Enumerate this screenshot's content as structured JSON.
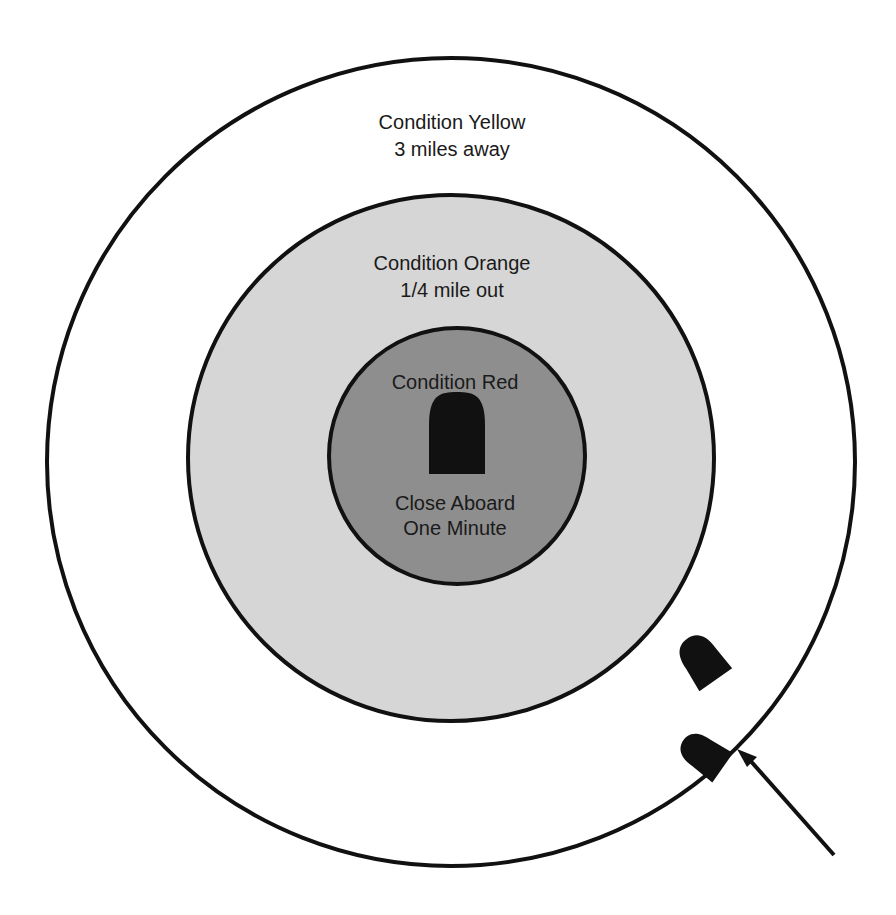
{
  "diagram": {
    "zones": [
      {
        "id": "yellow",
        "title": "Condition Yellow",
        "subtitle": "3 miles away",
        "fill": "#ffffff"
      },
      {
        "id": "orange",
        "title": "Condition Orange",
        "subtitle": "1/4 mile out",
        "fill": "#d6d6d6"
      },
      {
        "id": "red",
        "title": "Condition Red",
        "subtitle_line1": "Close Aboard",
        "subtitle_line2": "One Minute",
        "fill": "#8e8e8e"
      }
    ],
    "stroke_color": "#111111",
    "boat_color": "#111111"
  }
}
